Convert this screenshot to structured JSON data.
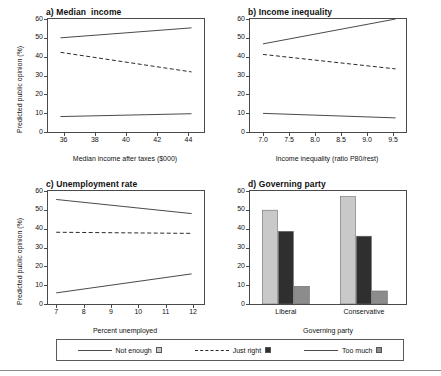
{
  "colors": {
    "not_enough": "#c9c9c9",
    "just_right": "#2f2f2f",
    "too_much": "#8c8c8c",
    "line": "#4a4a4a",
    "axis": "#4a4a4a"
  },
  "shared": {
    "ylabel": "Predicted public opinion (%)",
    "yticks": [
      "0",
      "10",
      "20",
      "30",
      "40",
      "50",
      "60"
    ],
    "ylim": [
      0,
      60
    ]
  },
  "legend": {
    "items": [
      {
        "label": "Not enough",
        "style": "solid",
        "swatch": "#c9c9c9"
      },
      {
        "label": "Just right",
        "style": "dashed",
        "swatch": "#2f2f2f"
      },
      {
        "label": "Too much",
        "style": "solid",
        "swatch": "#8c8c8c"
      }
    ]
  },
  "chart_data": [
    {
      "type": "line",
      "panel": "a",
      "title": "a) Median  income",
      "xlabel": "Median income after taxes ($000)",
      "ylabel": "Predicted public opinion (%)",
      "xticks": [
        "36",
        "38",
        "40",
        "42",
        "44"
      ],
      "yticks": [
        "0",
        "10",
        "20",
        "30",
        "40",
        "50",
        "60"
      ],
      "xlim": [
        35.0,
        45.0
      ],
      "ylim": [
        0,
        60
      ],
      "grid": false,
      "series": [
        {
          "name": "Not enough",
          "style": "solid",
          "x": [
            35.8,
            44.2
          ],
          "values": [
            50.0,
            55.3
          ]
        },
        {
          "name": "Just right",
          "style": "dashed",
          "x": [
            35.8,
            44.2
          ],
          "values": [
            42.3,
            31.9
          ]
        },
        {
          "name": "Too much",
          "style": "solid",
          "x": [
            35.8,
            44.2
          ],
          "values": [
            8.2,
            9.7
          ]
        }
      ]
    },
    {
      "type": "line",
      "panel": "b",
      "title": "b) Income inequality",
      "xlabel": "Income inequality (ratio P80/rest)",
      "ylabel": "Predicted public opinion (%)",
      "xticks": [
        "7.0",
        "7.5",
        "8.0",
        "8.5",
        "9.0",
        "9.5"
      ],
      "yticks": [
        "0",
        "10",
        "20",
        "30",
        "40",
        "50",
        "60"
      ],
      "xlim": [
        6.75,
        9.75
      ],
      "ylim": [
        0,
        60
      ],
      "grid": false,
      "series": [
        {
          "name": "Not enough",
          "style": "solid",
          "x": [
            7.0,
            9.55
          ],
          "values": [
            46.8,
            60.0
          ]
        },
        {
          "name": "Just right",
          "style": "dashed",
          "x": [
            7.0,
            9.55
          ],
          "values": [
            41.2,
            33.5
          ]
        },
        {
          "name": "Too much",
          "style": "solid",
          "x": [
            7.0,
            9.55
          ],
          "values": [
            9.9,
            7.5
          ]
        }
      ]
    },
    {
      "type": "line",
      "panel": "c",
      "title": "c) Unemployment rate",
      "xlabel": "Percent unemployed",
      "ylabel": "Predicted public opinion (%)",
      "xticks": [
        "7",
        "8",
        "9",
        "10",
        "11",
        "12"
      ],
      "yticks": [
        "0",
        "10",
        "20",
        "30",
        "40",
        "50",
        "60"
      ],
      "xlim": [
        6.7,
        12.4
      ],
      "ylim": [
        0,
        60
      ],
      "grid": false,
      "series": [
        {
          "name": "Not enough",
          "style": "solid",
          "x": [
            7.0,
            11.95
          ],
          "values": [
            55.5,
            48.0
          ]
        },
        {
          "name": "Just right",
          "style": "dashed",
          "x": [
            7.0,
            11.95
          ],
          "values": [
            38.1,
            37.5
          ]
        },
        {
          "name": "Too much",
          "style": "solid",
          "x": [
            7.0,
            11.95
          ],
          "values": [
            5.9,
            16.0
          ]
        }
      ]
    },
    {
      "type": "bar",
      "panel": "d",
      "title": "d) Governing party",
      "xlabel": "Governing party",
      "ylabel": "Predicted public opinion (%)",
      "categories": [
        "Liberal",
        "Conservative"
      ],
      "yticks": [
        "0",
        "10",
        "20",
        "30",
        "40",
        "50",
        "60"
      ],
      "ylim": [
        0,
        60
      ],
      "grid": false,
      "series": [
        {
          "name": "Not enough",
          "color": "#c9c9c9",
          "values": [
            49.8,
            57.0
          ]
        },
        {
          "name": "Just right",
          "color": "#2f2f2f",
          "values": [
            38.6,
            36.0
          ]
        },
        {
          "name": "Too much",
          "color": "#8c8c8c",
          "values": [
            9.4,
            6.9
          ]
        }
      ]
    }
  ]
}
